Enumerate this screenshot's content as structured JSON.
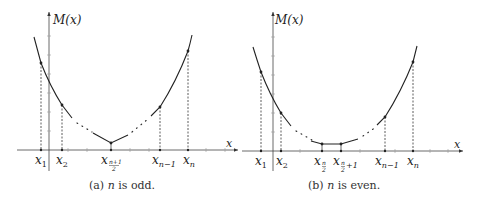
{
  "panels": [
    {
      "id": "a",
      "y_axis_label": "M(x)",
      "x_axis_label": "x",
      "caption": {
        "prefix": "(a) ",
        "var": "n",
        "suffix": " is odd."
      },
      "x_labels": [
        {
          "base": "x",
          "sub": "1"
        },
        {
          "base": "x",
          "sub": "2"
        },
        {
          "base": "x",
          "sub_frac_num": "n+1",
          "sub_frac_den": "2"
        },
        {
          "base": "x",
          "sub": "n−1"
        },
        {
          "base": "x",
          "sub": "n"
        }
      ]
    },
    {
      "id": "b",
      "y_axis_label": "M(x)",
      "x_axis_label": "x",
      "caption": {
        "prefix": "(b) ",
        "var": "n",
        "suffix": " is even."
      },
      "x_labels": [
        {
          "base": "x",
          "sub": "1"
        },
        {
          "base": "x",
          "sub": "2"
        },
        {
          "base": "x",
          "sub_frac_num": "n",
          "sub_frac_den": "2"
        },
        {
          "base": "x",
          "sub_frac_num": "n",
          "sub_frac_den": "2",
          "sub_extra": "+1"
        },
        {
          "base": "x",
          "sub": "n−1"
        },
        {
          "base": "x",
          "sub": "n"
        }
      ]
    }
  ]
}
